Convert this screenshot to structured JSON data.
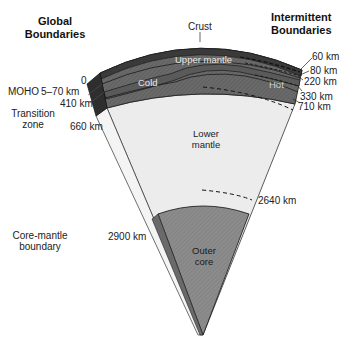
{
  "headers": {
    "global": [
      "Global",
      "Boundaries"
    ],
    "intermittent": [
      "Intermittent",
      "Boundaries"
    ]
  },
  "layers": {
    "crust": "Crust",
    "upper_mantle": "Upper mantle",
    "cold": "Cold",
    "hot": "Hot",
    "lower_mantle": [
      "Lower",
      "mantle"
    ],
    "outer_core": [
      "Outer",
      "core"
    ]
  },
  "global_boundaries": {
    "surface": "0",
    "moho_label": "MOHO",
    "moho_depth": "5–70 km",
    "d410": "410 km",
    "transition_zone": [
      "Transition",
      "zone"
    ],
    "d660": "660 km",
    "core_mantle_label": [
      "Core-mantle",
      "boundary"
    ],
    "d2900": "2900 km"
  },
  "intermittent_boundaries": [
    "60 km",
    "80 km",
    "220 km",
    "330 km",
    "710 km",
    "2640 km"
  ],
  "colors": {
    "crust_dark": "#3a3a3a",
    "upper_mantle": "#6e6e6e",
    "transition": "#8a8a8a",
    "lower_mantle": "#ececec",
    "outer_core": "#8c8c8c",
    "side_face": "#2e2e2e"
  }
}
